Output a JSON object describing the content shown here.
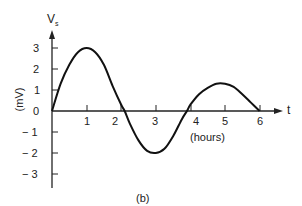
{
  "chart_data": {
    "type": "line",
    "title": "",
    "caption": "(b)",
    "xlabel": "(hours)",
    "x_axis_symbol": "t",
    "ylabel": "(mV)",
    "y_axis_symbol": "V",
    "y_axis_subscript": "s",
    "x_ticks": [
      "1",
      "2",
      "3",
      "4",
      "5",
      "6"
    ],
    "y_ticks": [
      "3",
      "2",
      "1",
      "0",
      "− 1",
      "− 2",
      "− 3"
    ],
    "xlim": [
      0,
      6.5
    ],
    "ylim": [
      -3.5,
      3.5
    ],
    "grid": false,
    "series": [
      {
        "name": "V_s",
        "x": [
          0,
          0.25,
          0.5,
          0.75,
          1.0,
          1.25,
          1.5,
          1.75,
          2.0,
          2.1,
          2.25,
          2.5,
          2.75,
          3.0,
          3.25,
          3.5,
          3.75,
          3.9,
          4.0,
          4.25,
          4.5,
          4.75,
          5.0,
          5.25,
          5.5,
          5.75,
          6.0
        ],
        "values": [
          0,
          1.3,
          2.2,
          2.8,
          3.0,
          2.8,
          2.2,
          1.2,
          0.3,
          0,
          -0.6,
          -1.4,
          -1.9,
          -2.0,
          -1.8,
          -1.2,
          -0.4,
          0,
          0.3,
          0.8,
          1.1,
          1.3,
          1.3,
          1.15,
          0.8,
          0.4,
          0
        ]
      }
    ]
  }
}
